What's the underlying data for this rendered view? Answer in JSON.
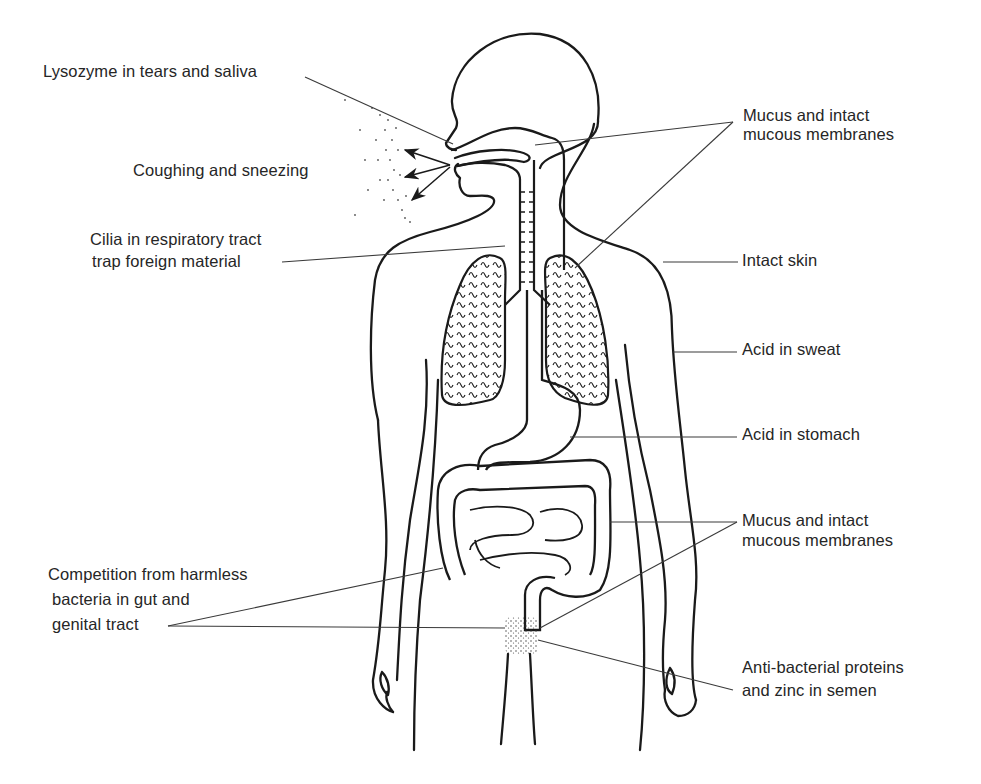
{
  "figure": {
    "line_color": "#1a1a1a",
    "leader_color": "#3a3a3a",
    "background": "#ffffff"
  },
  "labels": {
    "lysozyme": "Lysozyme in tears and saliva",
    "coughing": "Coughing and sneezing",
    "cilia_line1": "Cilia in respiratory tract",
    "cilia_line2": "trap foreign material",
    "mucus_top_line1": "Mucus and intact",
    "mucus_top_line2": "mucous membranes",
    "intact_skin": "Intact skin",
    "acid_sweat": "Acid in sweat",
    "acid_stomach": "Acid in stomach",
    "mucus_low_line1": "Mucus and intact",
    "mucus_low_line2": "mucous membranes",
    "competition_line1": "Competition from harmless",
    "competition_line2": "bacteria in gut and",
    "competition_line3": "genital tract",
    "antibacterial_line1": "Anti-bacterial proteins",
    "antibacterial_line2": "and zinc in semen"
  }
}
